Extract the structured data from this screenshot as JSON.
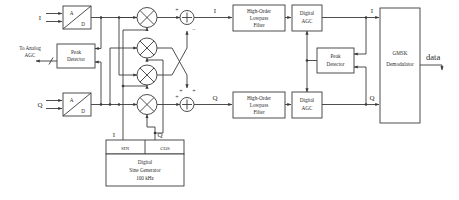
{
  "diagram": {
    "inputs": {
      "i_label": "I",
      "q_label": "Q"
    },
    "output": {
      "data_label": "data"
    },
    "blocks": {
      "adc_i": {
        "top": "A",
        "bottom": "D"
      },
      "adc_q": {
        "top": "A",
        "bottom": "D"
      },
      "peak_detector_left": {
        "line1": "Peak",
        "line2": "Detector"
      },
      "peak_detector_right": {
        "line1": "Peak",
        "line2": "Detector"
      },
      "lowpass_i": {
        "line1": "High-Order",
        "line2": "Lowpass",
        "line3": "Filter"
      },
      "lowpass_q": {
        "line1": "High-Order",
        "line2": "Lowpass",
        "line3": "Filter"
      },
      "agc_i": {
        "line1": "Digital",
        "line2": "AGC"
      },
      "agc_q": {
        "line1": "Digital",
        "line2": "AGC"
      },
      "demodulator": {
        "line1": "GMSK",
        "line2": "Demodulator"
      },
      "sine_generator": {
        "sin_label": "SIN",
        "cos_label": "COS",
        "line1": "Digital",
        "line2": "Sine Generator",
        "line3": "100 kHz"
      }
    },
    "annotations": {
      "to_analog_agc_line1": "To Analog",
      "to_analog_agc_line2": "AGC",
      "mid_i_label": "I",
      "mid_q_label": "Q",
      "gen_i_label": "I",
      "gen_q_label": "Q",
      "demod_i_label": "I",
      "demod_q_label": "Q"
    },
    "adder_signs": {
      "top_left": "+",
      "top_top": "+",
      "top_bottom": "−",
      "bot_left": "+",
      "bot_top": "+",
      "bot_right": "+"
    },
    "colors": {
      "wire": "#3a3a3a",
      "text": "#2b2b2b",
      "background": "#ffffff"
    }
  }
}
